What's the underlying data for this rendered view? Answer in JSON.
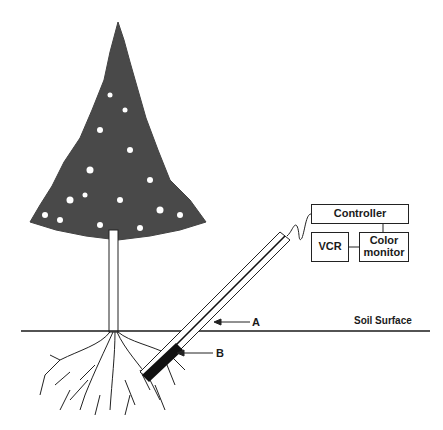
{
  "diagram": {
    "type": "minirhizotron-setup",
    "labels": {
      "soil_surface": "Soil Surface",
      "tube_label": "A",
      "camera_label": "B"
    },
    "equipment": {
      "controller": "Controller",
      "vcr": "VCR",
      "monitor_line1": "Color",
      "monitor_line2": "monitor"
    },
    "colors": {
      "ink": "#1a1a1a",
      "background": "#ffffff"
    }
  }
}
